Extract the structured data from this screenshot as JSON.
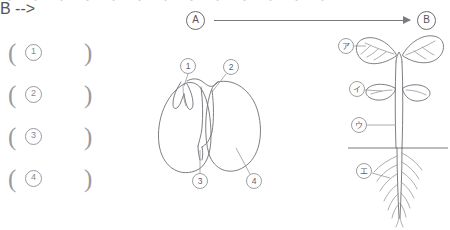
{
  "page": {
    "background_color": "#ffffff",
    "ink_color": "#6f6f75",
    "label_color": "#5e5e64",
    "clipped_top_text": "・ ・ ・ ・ ・ ・ ・ ・ ・ ・ ・ ・ ・"
  },
  "process": {
    "from_label": "A",
    "to_label": "B",
    "arrow_icon": "right-arrow-icon",
    "direction": "left-to-right"
  },
  "answer_blanks": {
    "open_paren": "(",
    "close_paren": ")",
    "rows": [
      {
        "number": "1",
        "value": ""
      },
      {
        "number": "2",
        "value": ""
      },
      {
        "number": "3",
        "value": ""
      },
      {
        "number": "4",
        "value": ""
      }
    ]
  },
  "seed_figure": {
    "caption": "",
    "description": "bean seed split open showing embryo and cotyledons",
    "callouts": [
      {
        "id": "1",
        "label": "1",
        "target": "plumule"
      },
      {
        "id": "2",
        "label": "2",
        "target": "hypocotyl-upper"
      },
      {
        "id": "3",
        "label": "3",
        "target": "radicle"
      },
      {
        "id": "4",
        "label": "4",
        "target": "cotyledon"
      }
    ]
  },
  "seedling_figure": {
    "caption": "",
    "description": "germinated seedling with true leaves, cotyledons, stem and root system below soil line",
    "soil_line_label": "",
    "callouts": [
      {
        "id": "a",
        "label": "ア",
        "target": "true-leaf"
      },
      {
        "id": "i",
        "label": "イ",
        "target": "cotyledon"
      },
      {
        "id": "u",
        "label": "ウ",
        "target": "stem"
      },
      {
        "id": "e",
        "label": "エ",
        "target": "root"
      }
    ]
  }
}
